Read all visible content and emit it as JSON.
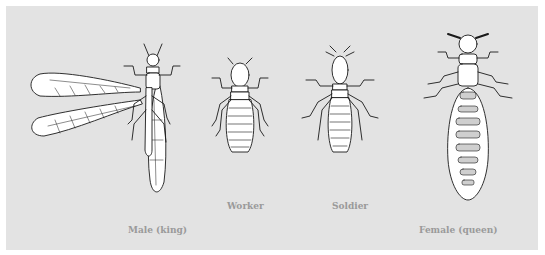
{
  "figure": {
    "background_color": "#e3e3e3",
    "label_color": "#9a9a9a",
    "castes": [
      {
        "id": "male",
        "label": "Male (king)",
        "winged": true
      },
      {
        "id": "worker",
        "label": "Worker",
        "winged": false
      },
      {
        "id": "soldier",
        "label": "Soldier",
        "winged": false
      },
      {
        "id": "female",
        "label": "Female (queen)",
        "winged": false
      }
    ]
  }
}
